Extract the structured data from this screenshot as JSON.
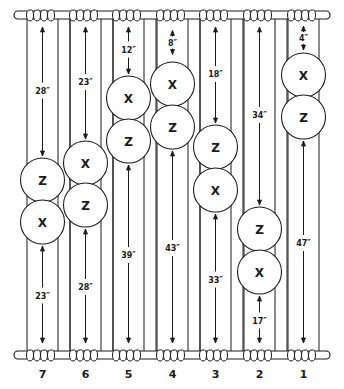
{
  "diagram": {
    "type": "curtain-strip-placement",
    "ink_color": "#1a1a1a",
    "background": "#ffffff",
    "columns": [
      {
        "number": "7",
        "top_gap": "28″",
        "bottom_gap": "23″",
        "markers": [
          "Z",
          "X"
        ]
      },
      {
        "number": "6",
        "top_gap": "23″",
        "bottom_gap": "28″",
        "markers": [
          "X",
          "Z"
        ]
      },
      {
        "number": "5",
        "top_gap": "12″",
        "bottom_gap": "39″",
        "markers": [
          "X",
          "Z"
        ]
      },
      {
        "number": "4",
        "top_gap": "8″",
        "bottom_gap": "43″",
        "markers": [
          "X",
          "Z"
        ]
      },
      {
        "number": "3",
        "top_gap": "18″",
        "bottom_gap": "33″",
        "markers": [
          "Z",
          "X"
        ]
      },
      {
        "number": "2",
        "top_gap": "34″",
        "bottom_gap": "17″",
        "markers": [
          "Z",
          "X"
        ]
      },
      {
        "number": "1",
        "top_gap": "4″",
        "bottom_gap": "47″",
        "markers": [
          "X",
          "Z"
        ]
      }
    ]
  }
}
